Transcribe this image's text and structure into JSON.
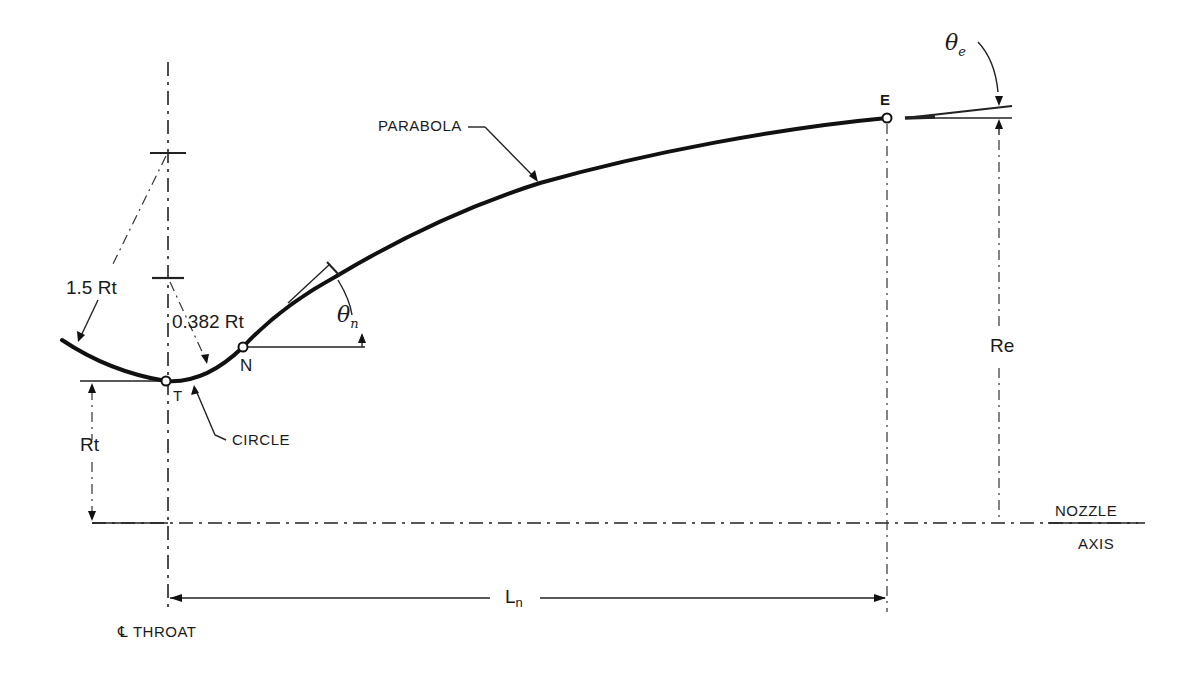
{
  "diagram": {
    "points": {
      "T": {
        "label": "T",
        "x": 166,
        "y": 381
      },
      "N": {
        "label": "N",
        "x": 243,
        "y": 347
      },
      "E": {
        "label": "E",
        "x": 887,
        "y": 118
      }
    },
    "labels": {
      "parabola": "PARABOLA",
      "circle": "CIRCLE",
      "upstream_radius": "1.5 Rt",
      "downstream_radius": "0.382 Rt",
      "throat_radius": "Rt",
      "exit_radius": "Re",
      "theta_n": "θ",
      "theta_n_sub": "n",
      "theta_e": "θ",
      "theta_e_sub": "e",
      "length": "L",
      "length_sub": "n",
      "throat_cl": "℄ THROAT",
      "nozzle_axis_line1": "NOZZLE",
      "nozzle_axis_line2": "AXIS"
    },
    "colors": {
      "ink": "#111111",
      "background": "#ffffff"
    }
  }
}
